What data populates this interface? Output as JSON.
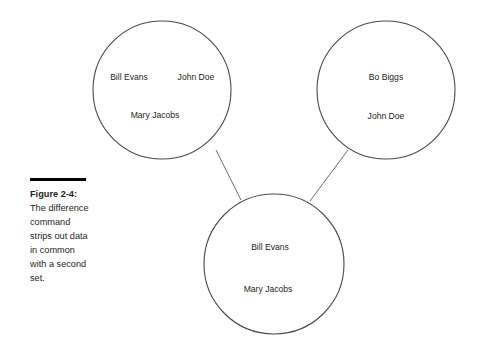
{
  "figure": {
    "caption_label": "Figure 2-4:",
    "caption_body": "The difference command strips out data in common with a second set.",
    "stroke_color": "#4a4a4a",
    "connector_color": "#6e6e6e",
    "text_color": "#231f20",
    "rule_color": "#000000",
    "background_color": "#ffffff"
  },
  "sets": [
    {
      "id": "top-left",
      "cx": 162,
      "cy": 90,
      "r": 69,
      "members": [
        {
          "text": "Bill Evans",
          "x": 129,
          "y": 78
        },
        {
          "text": "John Doe",
          "x": 196,
          "y": 78
        },
        {
          "text": "Mary Jacobs",
          "x": 155,
          "y": 116
        }
      ]
    },
    {
      "id": "top-right",
      "cx": 386,
      "cy": 90,
      "r": 69,
      "members": [
        {
          "text": "Bo Biggs",
          "x": 386,
          "y": 78
        },
        {
          "text": "John Doe",
          "x": 386,
          "y": 117
        }
      ]
    },
    {
      "id": "bottom-result",
      "cx": 274,
      "cy": 264,
      "r": 70,
      "members": [
        {
          "text": "Bill Evans",
          "x": 270,
          "y": 248
        },
        {
          "text": "Mary Jacobs",
          "x": 268,
          "y": 290
        }
      ]
    }
  ],
  "connectors": [
    {
      "id": "left-to-result",
      "x1": 216,
      "y1": 150,
      "x2": 241,
      "y2": 200
    },
    {
      "id": "right-to-result",
      "x1": 348,
      "y1": 150,
      "x2": 310,
      "y2": 201
    }
  ]
}
